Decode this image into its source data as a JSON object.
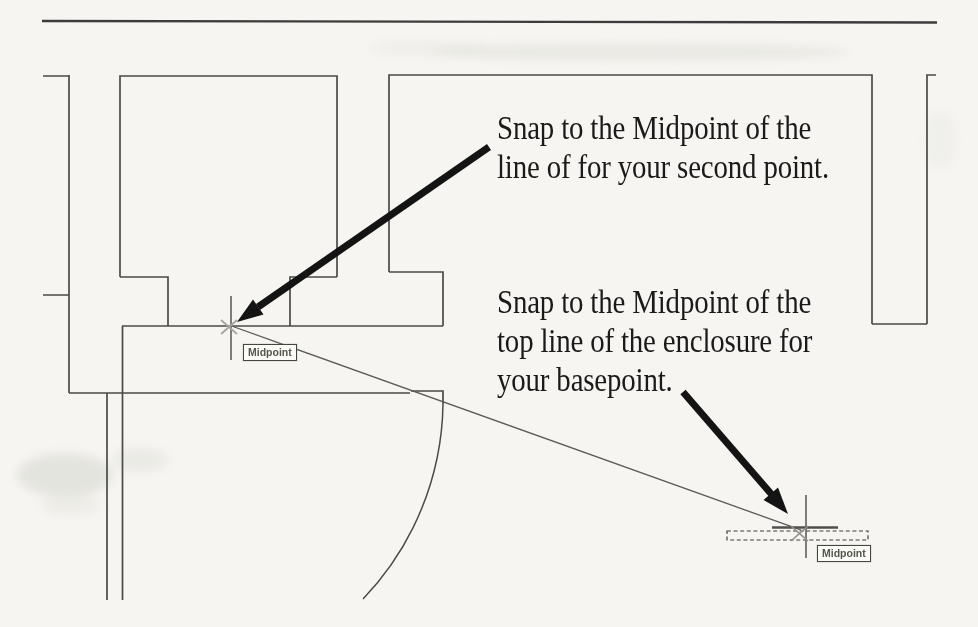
{
  "page": {
    "type": "scanned tutorial page (CAD move/snap exercise figure)",
    "background_color": "#f6f5f2"
  },
  "annotations": {
    "second_point": {
      "lines": [
        "Snap to the Midpoint of the",
        "line of for your second point."
      ]
    },
    "basepoint": {
      "lines": [
        "Snap to the Midpoint of the",
        "top line of the enclosure for",
        "your basepoint."
      ]
    }
  },
  "drawing": {
    "osnap_tooltips": [
      {
        "label": "Midpoint"
      },
      {
        "label": "Midpoint"
      }
    ],
    "colors": {
      "wall_line": "#4a4a4a",
      "top_rule": "#3c3c3c",
      "arrow": "#141414",
      "annotation_text": "#1a1a1a",
      "dashed_selection": "#3f3f3f",
      "crosshair": "#5f5f5f",
      "osnap_marker": "#a5a59e"
    }
  }
}
